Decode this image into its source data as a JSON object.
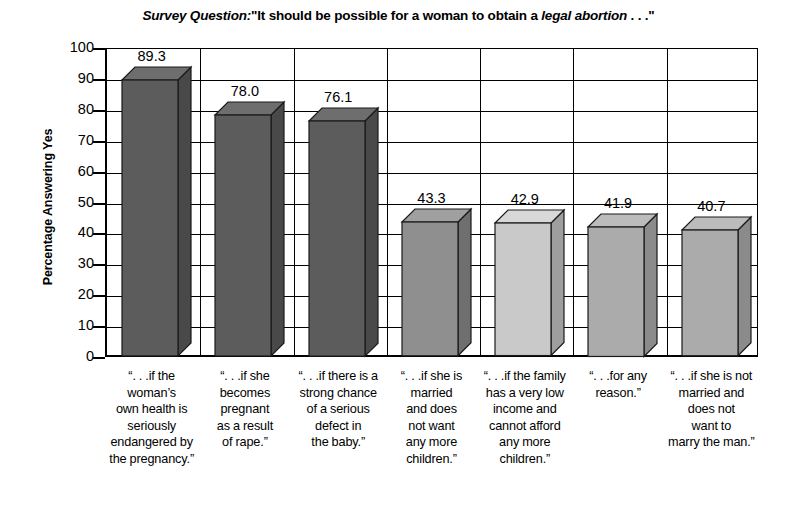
{
  "chart_data": {
    "type": "bar",
    "title_parts": {
      "lead": "Survey Question:",
      "mid": "\"It should be possible for a woman to obtain a ",
      "emphasis": "legal abortion",
      "tail": " . . .\""
    },
    "xlabel": "",
    "ylabel": "Percentage Answering Yes",
    "ylim": [
      0,
      100
    ],
    "ytick_step": 10,
    "yticks": [
      "100",
      "90",
      "80",
      "70",
      "60",
      "50",
      "40",
      "30",
      "20",
      "10",
      "0"
    ],
    "grid": "horizontal-and-vertical",
    "legend": "none",
    "categories": [
      "“. . .if the woman’s own health is seriously endangered by the pregnancy.”",
      "“. . .if she becomes pregnant as a result of rape.”",
      "“. . .if there is a strong chance of a serious defect in the baby.”",
      "“. . .if she is married and does not want any more children.”",
      "“. . .if the family has a very low income and cannot afford any more children.”",
      "“. . .for any reason.”",
      "“. . .if she is not married and does not want to marry the man.”"
    ],
    "category_lines": [
      [
        "“. . .if the",
        "woman’s",
        "own health is",
        "seriously",
        "endangered by",
        "the pregnancy.”"
      ],
      [
        "“. . .if she",
        "becomes",
        "pregnant",
        "as a result",
        "of rape.”"
      ],
      [
        "“. . .if there is a",
        "strong chance",
        "of a serious",
        "defect in",
        "the baby.”"
      ],
      [
        "“. . .if she is",
        "married",
        "and does",
        "not want",
        "any more",
        "children.”"
      ],
      [
        "“. . .if the family",
        "has a very low",
        "income and",
        "cannot afford",
        "any more",
        "children.”"
      ],
      [
        "“. . .for any",
        "reason.”"
      ],
      [
        "“. . .if she is not",
        "married and",
        "does not",
        "want to",
        "marry the man.”"
      ]
    ],
    "values": [
      89.3,
      78.0,
      76.1,
      43.3,
      42.9,
      41.9,
      40.7
    ],
    "value_labels": [
      "89.3",
      "78.0",
      "76.1",
      "43.3",
      "42.9",
      "41.9",
      "40.7"
    ],
    "bar_colors": {
      "front": [
        "#5c5c5c",
        "#5c5c5c",
        "#5c5c5c",
        "#8f8f8f",
        "#c9c9c9",
        "#ababab",
        "#ababab"
      ],
      "top": [
        "#6e6e6e",
        "#6e6e6e",
        "#6e6e6e",
        "#a0a0a0",
        "#d8d8d8",
        "#bcbcbc",
        "#bcbcbc"
      ],
      "side": [
        "#494949",
        "#494949",
        "#494949",
        "#6f6f6f",
        "#9e9e9e",
        "#8b8b8b",
        "#8b8b8b"
      ]
    },
    "axis_color": "#000000",
    "background_color": "#ffffff"
  }
}
